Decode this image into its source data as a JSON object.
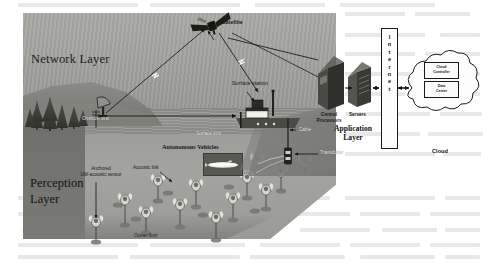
{
  "figure": {
    "background": "#ffffff"
  },
  "colors": {
    "sky": "#a3a3a0",
    "water": "#9c9c99",
    "water_dark": "#767673",
    "ocean_surface": "#92928f",
    "ink": "#1a1a1a",
    "panel": "#fbfbfb"
  },
  "layers": {
    "network": "Network Layer",
    "perception_line1": "Perception",
    "perception_line2": "Layer",
    "application_line1": "Application",
    "application_line2": "Layer"
  },
  "network_layer": {
    "satellite": "Satellite",
    "onshore_sink": "Onshore sink",
    "surface_station": "Surface station",
    "surface_sink": "Surface sink",
    "cable": "Cable",
    "transducer": "Transducer"
  },
  "perception_layer": {
    "autonomous_vehicles": "Autonomous Vehicles",
    "acoustic_link": "Acoustic link",
    "anchored_sensor_line1": "Anchored",
    "anchored_sensor_line2": "UW-acoustic sensor",
    "ocean_floor": "Ocean floor"
  },
  "application_layer": {
    "central_processors_line1": "Central",
    "central_processors_line2": "Processors",
    "servers": "Servers",
    "internet": "Internet",
    "internet_letters": [
      "I",
      "n",
      "t",
      "e",
      "r",
      "n",
      "e",
      "t"
    ],
    "cloud": "Cloud",
    "cloud_controller_line1": "Cloud",
    "cloud_controller_line2": "Controller",
    "data_center_line1": "Data",
    "data_center_line2": "Center"
  },
  "chart_data": {
    "type": "diagram",
    "nodes": [
      {
        "id": "satellite",
        "label": "Satellite",
        "layer": "network",
        "x": 212,
        "y": 22
      },
      {
        "id": "onshore-sink",
        "label": "Onshore sink",
        "layer": "network",
        "x": 100,
        "y": 113
      },
      {
        "id": "surface-station",
        "label": "Surface station",
        "layer": "network",
        "x": 258,
        "y": 85
      },
      {
        "id": "surface-sink",
        "label": "Surface sink",
        "layer": "network",
        "x": 215,
        "y": 130
      },
      {
        "id": "cable",
        "label": "Cable",
        "layer": "network",
        "x": 298,
        "y": 130
      },
      {
        "id": "transducer",
        "label": "Transducer",
        "layer": "network",
        "x": 300,
        "y": 152
      },
      {
        "id": "autonomous-vehicles",
        "label": "Autonomous Vehicles",
        "layer": "perception",
        "x": 205,
        "y": 146
      },
      {
        "id": "acoustic-link",
        "label": "Acoustic link",
        "layer": "perception",
        "x": 160,
        "y": 165
      },
      {
        "id": "anchored-sensor",
        "label": "Anchored UW-acoustic sensor",
        "layer": "perception",
        "x": 125,
        "y": 172
      },
      {
        "id": "ocean-floor",
        "label": "Ocean floor",
        "layer": "perception",
        "x": 152,
        "y": 236
      },
      {
        "id": "central-processors",
        "label": "Central Processors",
        "layer": "application",
        "x": 335,
        "y": 85
      },
      {
        "id": "servers",
        "label": "Servers",
        "layer": "application",
        "x": 363,
        "y": 88
      },
      {
        "id": "internet",
        "label": "Internet",
        "layer": "application",
        "x": 388,
        "y": 88
      },
      {
        "id": "cloud-controller",
        "label": "Cloud Controller",
        "layer": "application",
        "x": 440,
        "y": 70
      },
      {
        "id": "data-center",
        "label": "Data Center",
        "layer": "application",
        "x": 440,
        "y": 88
      },
      {
        "id": "cloud",
        "label": "Cloud",
        "layer": "application",
        "x": 440,
        "y": 150
      }
    ],
    "edges": [
      {
        "from": "onshore-sink",
        "to": "satellite",
        "kind": "rf-wireless"
      },
      {
        "from": "satellite",
        "to": "surface-station",
        "kind": "rf-wireless"
      },
      {
        "from": "onshore-sink",
        "to": "surface-sink",
        "kind": "wired"
      },
      {
        "from": "surface-station",
        "to": "transducer",
        "kind": "cable"
      },
      {
        "from": "transducer",
        "to": "autonomous-vehicles",
        "kind": "acoustic"
      },
      {
        "from": "anchored-sensor",
        "to": "ocean-floor",
        "kind": "anchor"
      },
      {
        "from": "surface-station",
        "to": "central-processors",
        "kind": "wired"
      },
      {
        "from": "central-processors",
        "to": "servers",
        "kind": "wired"
      },
      {
        "from": "servers",
        "to": "internet",
        "kind": "wired-bidirectional"
      },
      {
        "from": "internet",
        "to": "cloud",
        "kind": "wired-bidirectional"
      }
    ]
  }
}
